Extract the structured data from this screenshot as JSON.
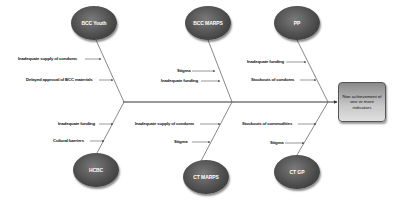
{
  "diagram": {
    "type": "fishbone",
    "effect": "Non achievement of one or more indicators",
    "categories": [
      {
        "name": "BCC Youth",
        "position": "top",
        "causes": [
          "Inadequate supply of condoms",
          "Delayed approval of BCC materials"
        ]
      },
      {
        "name": "BCC MARPS",
        "position": "top",
        "causes": [
          "Stigma",
          "Inadequate funding"
        ]
      },
      {
        "name": "PP",
        "position": "top",
        "causes": [
          "Inadequate funding",
          "Stockouts of condoms"
        ]
      },
      {
        "name": "HCBC",
        "position": "bottom",
        "causes": [
          "Inadequate funding",
          "Cultural barriers"
        ]
      },
      {
        "name": "CT MARPS",
        "position": "bottom",
        "causes": [
          "Inadequate supply of condoms",
          "Stigma"
        ]
      },
      {
        "name": "CT GP",
        "position": "bottom",
        "causes": [
          "Stockouts of commodities",
          "Stigma"
        ]
      }
    ]
  },
  "colors": {
    "category_fill": "#4a4a4a",
    "line": "#333333",
    "effect_fill": "#c8c8c8"
  }
}
